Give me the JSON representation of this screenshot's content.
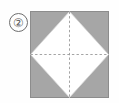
{
  "step": {
    "number_label": "2",
    "badge_glyph": "②"
  },
  "figure": {
    "shapes": {
      "outer_square": {
        "name": "gray-paper-square",
        "fill": "#a6a6a6",
        "stroke": "#8c8c8c",
        "x": 0,
        "y": 0,
        "width": 79,
        "height": 87
      },
      "inner_diamond": {
        "name": "white-diamond-panel",
        "fill": "#ffffff",
        "stroke": "#d8d8d8",
        "points": "39.5,0 79,43.5 39.5,87 0,43.5"
      }
    },
    "fold_lines": [
      {
        "name": "vertical-fold-crease",
        "orientation": "vertical",
        "style": "dashed",
        "color": "#9a9a9a",
        "x1": 39.5,
        "y1": 0,
        "x2": 39.5,
        "y2": 87
      },
      {
        "name": "horizontal-fold-crease",
        "orientation": "horizontal",
        "style": "dashed",
        "color": "#9a9a9a",
        "x1": 0,
        "y1": 43.5,
        "x2": 79,
        "y2": 43.5
      }
    ]
  },
  "colors": {
    "background": "#fefefe",
    "paper_gray": "#a6a6a6",
    "paper_white": "#ffffff",
    "crease": "#9a9a9a",
    "outline": "#8c8c8c",
    "badge_outline": "#6e6e6e",
    "badge_text": "#5a5a5a"
  }
}
